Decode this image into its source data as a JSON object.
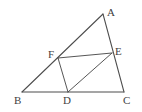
{
  "figure": {
    "background_color": "#ffffff",
    "stroke_color": "#4d4d4d",
    "label_color": "#3f3f3f",
    "canvas": {
      "width": 142,
      "height": 112
    },
    "points": {
      "A": {
        "label": "A",
        "x": 103,
        "y": 14,
        "label_x": 107,
        "label_y": 7
      },
      "B": {
        "label": "B",
        "x": 22,
        "y": 92,
        "label_x": 14,
        "label_y": 95
      },
      "C": {
        "label": "C",
        "x": 124,
        "y": 92,
        "label_x": 123,
        "label_y": 95
      },
      "D": {
        "label": "D",
        "x": 68,
        "y": 92,
        "label_x": 63,
        "label_y": 95
      },
      "E": {
        "label": "E",
        "x": 112,
        "y": 53,
        "label_x": 115,
        "label_y": 46
      },
      "F": {
        "label": "F",
        "x": 58,
        "y": 58,
        "label_x": 48,
        "label_y": 49
      }
    },
    "segments": [
      {
        "name": "segment-BC",
        "from": "B",
        "to": "C"
      },
      {
        "name": "segment-BA",
        "from": "B",
        "to": "A"
      },
      {
        "name": "segment-AC",
        "from": "A",
        "to": "C"
      },
      {
        "name": "segment-FD",
        "from": "F",
        "to": "D"
      },
      {
        "name": "segment-DE",
        "from": "D",
        "to": "E"
      },
      {
        "name": "segment-FE",
        "from": "F",
        "to": "E"
      }
    ]
  }
}
